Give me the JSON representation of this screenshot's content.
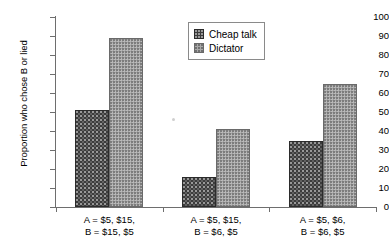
{
  "chart_data": {
    "type": "bar",
    "title": "",
    "subtitle": "",
    "xlabel": "",
    "ylabel": "Proportion who chose B or lied",
    "ylim": [
      0,
      100
    ],
    "ytick_step": 10,
    "yticks": [
      0,
      10,
      20,
      30,
      40,
      50,
      60,
      70,
      80,
      90,
      100
    ],
    "grid": false,
    "legend_position": "top-center",
    "categories": [
      "A = $5, $15,\nB = $15, $5",
      "A = $5, $15,\nB = $6, $5",
      "A = $5, $6,\nB = $6, $5"
    ],
    "category_lines": [
      {
        "line1": "A = $5, $15,",
        "line2": "B = $15, $5"
      },
      {
        "line1": "A = $5, $15,",
        "line2": "B = $6, $5"
      },
      {
        "line1": "A = $5, $6,",
        "line2": "B = $6, $5"
      }
    ],
    "series": [
      {
        "name": "Cheap talk",
        "values": [
          51,
          16,
          35
        ],
        "color": "#3c3c3c",
        "pattern": "dark-speckled"
      },
      {
        "name": "Dictator",
        "values": [
          89,
          41,
          65
        ],
        "color": "#a3a3a3",
        "pattern": "light-checkered"
      }
    ]
  },
  "legend": {
    "items": [
      {
        "label": "Cheap talk",
        "swatch": "cheap"
      },
      {
        "label": "Dictator",
        "swatch": "dictator"
      }
    ]
  },
  "axis": {
    "y_title": "Proportion who chose B or lied",
    "y_labels": [
      "100",
      "90",
      "80",
      "70",
      "60",
      "50",
      "40",
      "30",
      "20",
      "10",
      "0"
    ]
  },
  "colors": {
    "axis": "#6e6e6e",
    "text": "#000000",
    "background": "#ffffff",
    "series_cheap_talk": "#3c3c3c",
    "series_dictator": "#a3a3a3"
  }
}
